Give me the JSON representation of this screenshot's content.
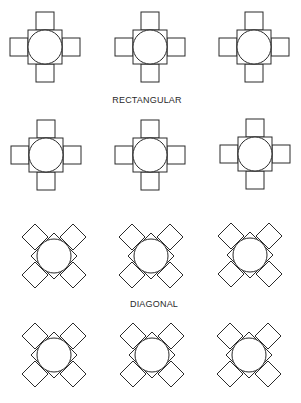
{
  "figure": {
    "type": "table-seating-arrangements",
    "stroke_color": "#2a2a2a",
    "background": "#ffffff"
  },
  "sections": [
    {
      "label": "RECTANGULAR",
      "label_pos": [
        147,
        96
      ],
      "arrangement": "rectangular",
      "tables": [
        {
          "cx": 45,
          "cy": 47
        },
        {
          "cx": 150,
          "cy": 47
        },
        {
          "cx": 254,
          "cy": 47
        },
        {
          "cx": 46,
          "cy": 155
        },
        {
          "cx": 150,
          "cy": 155
        },
        {
          "cx": 255,
          "cy": 154
        }
      ]
    },
    {
      "label": "DIAGONAL",
      "label_pos": [
        154,
        300
      ],
      "arrangement": "diagonal",
      "tables": [
        {
          "cx": 54,
          "cy": 256
        },
        {
          "cx": 151,
          "cy": 256
        },
        {
          "cx": 250,
          "cy": 255
        },
        {
          "cx": 54,
          "cy": 355
        },
        {
          "cx": 152,
          "cy": 355
        },
        {
          "cx": 249,
          "cy": 355
        }
      ]
    }
  ],
  "table_geometry": {
    "circle_radius": 17,
    "square_half": 17,
    "chair_size": 18,
    "rect_chair_offset": 26,
    "diag_chair_offset": 19,
    "diag_chair_half_diag": 13,
    "diag_table_half_diag": 23
  }
}
